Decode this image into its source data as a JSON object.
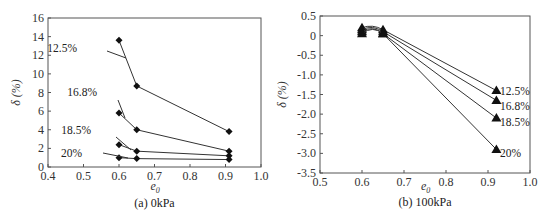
{
  "chart_data": [
    {
      "type": "line",
      "panel": "left",
      "caption": "(a) 0kPa",
      "xlabel": "e0",
      "xlabel_main": "e",
      "xlabel_sub": "0",
      "ylabel": "δ (%)",
      "xlim": [
        0.4,
        1.0
      ],
      "ylim": [
        0,
        16
      ],
      "xticks": [
        "0.4",
        "0.5",
        "0.6",
        "0.7",
        "0.8",
        "0.9",
        "1.0"
      ],
      "yticks": [
        "0",
        "2",
        "4",
        "6",
        "8",
        "10",
        "12",
        "14",
        "16"
      ],
      "marker": "diamond",
      "grid": false,
      "x": [
        0.6,
        0.65,
        0.91
      ],
      "series": [
        {
          "name": "12.5%",
          "values": [
            13.6,
            8.7,
            3.8
          ]
        },
        {
          "name": "16.8%",
          "values": [
            5.8,
            4.0,
            1.7
          ]
        },
        {
          "name": "18.5%",
          "values": [
            2.4,
            1.7,
            1.2
          ]
        },
        {
          "name": "20%",
          "values": [
            1.0,
            0.9,
            0.8
          ]
        }
      ]
    },
    {
      "type": "line",
      "panel": "right",
      "caption": "(b) 100kPa",
      "xlabel": "e0",
      "xlabel_main": "e",
      "xlabel_sub": "0",
      "ylabel": "δ (%)",
      "xlim": [
        0.5,
        1.0
      ],
      "ylim": [
        -3.5,
        0.5
      ],
      "xticks": [
        "0.5",
        "0.6",
        "0.7",
        "0.8",
        "0.9",
        "1.0"
      ],
      "yticks": [
        "0.5",
        "0",
        "-0.5",
        "-1.0",
        "-1.5",
        "-2.0",
        "-2.5",
        "-3.0",
        "-3.5"
      ],
      "marker": "triangle",
      "grid": false,
      "x": [
        0.6,
        0.65,
        0.92
      ],
      "series": [
        {
          "name": "12.5%",
          "values": [
            0.2,
            0.15,
            -1.4
          ]
        },
        {
          "name": "16.8%",
          "values": [
            0.15,
            0.1,
            -1.65
          ]
        },
        {
          "name": "18.5%",
          "values": [
            0.1,
            0.05,
            -2.1
          ]
        },
        {
          "name": "20%",
          "values": [
            0.05,
            0.05,
            -2.9
          ]
        }
      ]
    }
  ]
}
